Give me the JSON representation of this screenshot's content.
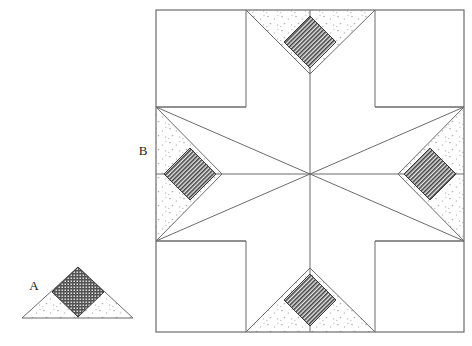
{
  "figure": {
    "background_color": "#ffffff",
    "line_color": "#595959",
    "stipple_fill_color": "#b0b0b0",
    "hatch_fill_color": "#4a4a4a",
    "labels": [
      {
        "id": "label-a",
        "text": "A",
        "x": 34,
        "y": 287
      },
      {
        "id": "label-b",
        "text": "B",
        "x": 143,
        "y": 152
      }
    ],
    "small_figure": {
      "name": "triangle-unit-a",
      "apex": {
        "x": 78,
        "y": 267
      },
      "base_left": {
        "x": 22,
        "y": 318
      },
      "base_right": {
        "x": 133,
        "y": 318
      },
      "center_stem": {
        "x": 78,
        "y": 318
      },
      "diamond": {
        "top": {
          "x": 78,
          "y": 267
        },
        "right": {
          "x": 104,
          "y": 292
        },
        "bottom": {
          "x": 78,
          "y": 317
        },
        "left": {
          "x": 52,
          "y": 292
        }
      }
    },
    "large_figure": {
      "name": "star-block",
      "outer_square": {
        "x": 156,
        "y": 10,
        "width": 308,
        "height": 322
      },
      "grid_x": [
        156,
        246,
        375,
        464
      ],
      "grid_y": [
        10,
        107,
        241,
        332
      ],
      "center": {
        "x": 310,
        "y": 174
      },
      "diamond_half_width": 26,
      "diamond_half_height": 26,
      "points": [
        {
          "name": "star-point-top",
          "cx": 310,
          "cy": 42
        },
        {
          "name": "star-point-bottom",
          "cx": 310,
          "cy": 300
        },
        {
          "name": "star-point-left",
          "cx": 190,
          "cy": 174
        },
        {
          "name": "star-point-right",
          "cx": 430,
          "cy": 174
        }
      ]
    }
  }
}
